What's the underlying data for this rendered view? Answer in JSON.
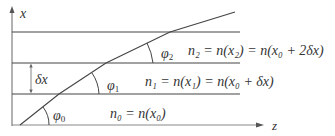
{
  "axes": {
    "x_label": "x",
    "z_label": "z"
  },
  "spacing_label": "δx",
  "angles": [
    {
      "sym": "φ",
      "sub": "0"
    },
    {
      "sym": "φ",
      "sub": "1"
    },
    {
      "sym": "φ",
      "sub": "2"
    }
  ],
  "layers": [
    {
      "label": "n₀ = n(x₀)"
    },
    {
      "label": "n₁ = n(x₁) = n(x₀ + δx)"
    },
    {
      "label": "n₂ = n(x₂) = n(x₀ + 2δx)"
    }
  ],
  "colors": {
    "line": "#444444",
    "axis": "#666666",
    "text": "#333333"
  }
}
